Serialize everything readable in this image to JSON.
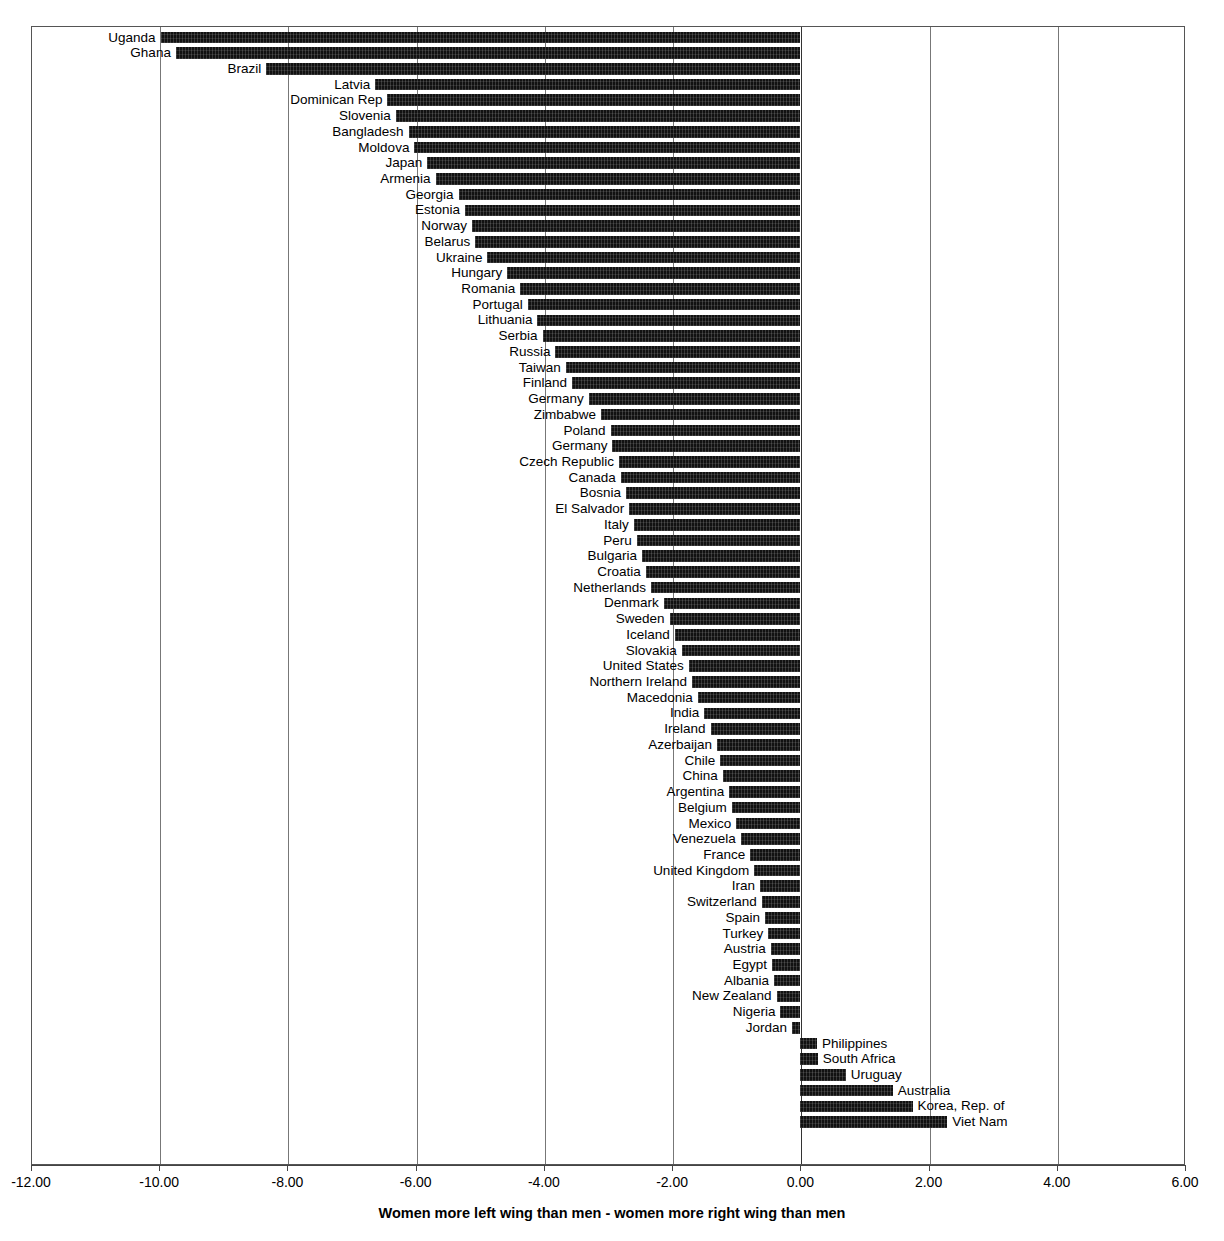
{
  "chart_data": {
    "type": "bar",
    "orientation": "horizontal",
    "title": "",
    "xlabel": "Women more left wing than men - women more right wing than men",
    "ylabel": "",
    "xlim": [
      -12.0,
      6.0
    ],
    "xticks": [
      "-12.00",
      "-10.00",
      "-8.00",
      "-6.00",
      "-4.00",
      "-2.00",
      "0.00",
      "2.00",
      "4.00",
      "6.00"
    ],
    "xtick_values": [
      -12,
      -10,
      -8,
      -6,
      -4,
      -2,
      0,
      2,
      4,
      6
    ],
    "grid": true,
    "legend": "none",
    "bar_color": "#111111",
    "categories": [
      "Uganda",
      "Ghana",
      "Brazil",
      "Latvia",
      "Dominican Rep",
      "Slovenia",
      "Bangladesh",
      "Moldova",
      "Japan",
      "Armenia",
      "Georgia",
      "Estonia",
      "Norway",
      "Belarus",
      "Ukraine",
      "Hungary",
      "Romania",
      "Portugal",
      "Lithuania",
      "Serbia",
      "Russia",
      "Taiwan",
      "Finland",
      "Germany",
      "Zimbabwe",
      "Poland",
      "Germany",
      "Czech Republic",
      "Canada",
      "Bosnia",
      "El Salvador",
      "Italy",
      "Peru",
      "Bulgaria",
      "Croatia",
      "Netherlands",
      "Denmark",
      "Sweden",
      "Iceland",
      "Slovakia",
      "United States",
      "Northern Ireland",
      "Macedonia",
      "India",
      "Ireland",
      "Azerbaijan",
      "Chile",
      "China",
      "Argentina",
      "Belgium",
      "Mexico",
      "Venezuela",
      "France",
      "United Kingdom",
      "Iran",
      "Switzerland",
      "Spain",
      "Turkey",
      "Austria",
      "Egypt",
      "Albania",
      "New Zealand",
      "Nigeria",
      "Jordan",
      "Philippines",
      "South Africa",
      "Uruguay",
      "Australia",
      "Korea, Rep. of",
      "Viet Nam"
    ],
    "values": [
      -9.98,
      -9.74,
      -8.33,
      -6.63,
      -6.44,
      -6.31,
      -6.11,
      -6.02,
      -5.82,
      -5.69,
      -5.33,
      -5.23,
      -5.12,
      -5.07,
      -4.88,
      -4.57,
      -4.37,
      -4.25,
      -4.1,
      -4.02,
      -3.82,
      -3.66,
      -3.56,
      -3.3,
      -3.11,
      -2.96,
      -2.93,
      -2.83,
      -2.8,
      -2.72,
      -2.67,
      -2.6,
      -2.55,
      -2.47,
      -2.41,
      -2.33,
      -2.13,
      -2.04,
      -1.96,
      -1.85,
      -1.74,
      -1.69,
      -1.6,
      -1.5,
      -1.4,
      -1.3,
      -1.25,
      -1.21,
      -1.11,
      -1.07,
      -1.0,
      -0.93,
      -0.78,
      -0.72,
      -0.63,
      -0.6,
      -0.55,
      -0.5,
      -0.46,
      -0.44,
      -0.41,
      -0.37,
      -0.31,
      -0.13,
      0.26,
      0.27,
      0.71,
      1.44,
      1.75,
      2.29
    ]
  }
}
